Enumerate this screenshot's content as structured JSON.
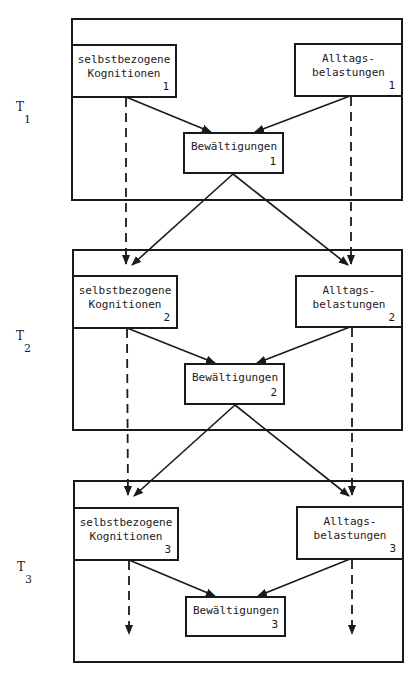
{
  "diagram": {
    "type": "longitudinal path model",
    "time_points": [
      {
        "label": "T",
        "index": "1",
        "left_node": {
          "line1": "selbstbezogene",
          "line2": "Kognitionen",
          "sub": "1"
        },
        "right_node": {
          "line1": "Alltags-",
          "line2": "belastungen",
          "sub": "1"
        },
        "center_node": {
          "line1": "Bewältigungen",
          "sub": "1"
        }
      },
      {
        "label": "T",
        "index": "2",
        "left_node": {
          "line1": "selbstbezogene",
          "line2": "Kognitionen",
          "sub": "2"
        },
        "right_node": {
          "line1": "Alltags-",
          "line2": "belastungen",
          "sub": "2"
        },
        "center_node": {
          "line1": "Bewältigungen",
          "sub": "2"
        }
      },
      {
        "label": "T",
        "index": "3",
        "left_node": {
          "line1": "selbstbezogene",
          "line2": "Kognitionen",
          "sub": "3"
        },
        "right_node": {
          "line1": "Alltags-",
          "line2": "belastungen",
          "sub": "3"
        },
        "center_node": {
          "line1": "Bewältigungen",
          "sub": "3"
        }
      }
    ],
    "edges": [
      {
        "from": "selbstbezogene Kognitionen 1",
        "to": "Bewältigungen 1",
        "style": "solid"
      },
      {
        "from": "Alltagsbelastungen 1",
        "to": "Bewältigungen 1",
        "style": "solid"
      },
      {
        "from": "Bewältigungen 1",
        "to": "selbstbezogene Kognitionen 2",
        "style": "solid"
      },
      {
        "from": "Bewältigungen 1",
        "to": "Alltagsbelastungen 2",
        "style": "solid"
      },
      {
        "from": "selbstbezogene Kognitionen 1",
        "to": "selbstbezogene Kognitionen 2",
        "style": "dashed"
      },
      {
        "from": "Alltagsbelastungen 1",
        "to": "Alltagsbelastungen 2",
        "style": "dashed"
      },
      {
        "from": "selbstbezogene Kognitionen 2",
        "to": "Bewältigungen 2",
        "style": "solid"
      },
      {
        "from": "Alltagsbelastungen 2",
        "to": "Bewältigungen 2",
        "style": "solid"
      },
      {
        "from": "Bewältigungen 2",
        "to": "selbstbezogene Kognitionen 3",
        "style": "solid"
      },
      {
        "from": "Bewältigungen 2",
        "to": "Alltagsbelastungen 3",
        "style": "solid"
      },
      {
        "from": "selbstbezogene Kognitionen 2",
        "to": "selbstbezogene Kognitionen 3",
        "style": "dashed"
      },
      {
        "from": "Alltagsbelastungen 2",
        "to": "Alltagsbelastungen 3",
        "style": "dashed"
      },
      {
        "from": "selbstbezogene Kognitionen 3",
        "to": "Bewältigungen 3",
        "style": "solid"
      },
      {
        "from": "Alltagsbelastungen 3",
        "to": "Bewältigungen 3",
        "style": "solid"
      },
      {
        "from": "selbstbezogene Kognitionen 3",
        "to": "(continues)",
        "style": "dashed"
      },
      {
        "from": "Alltagsbelastungen 3",
        "to": "(continues)",
        "style": "dashed"
      }
    ]
  }
}
